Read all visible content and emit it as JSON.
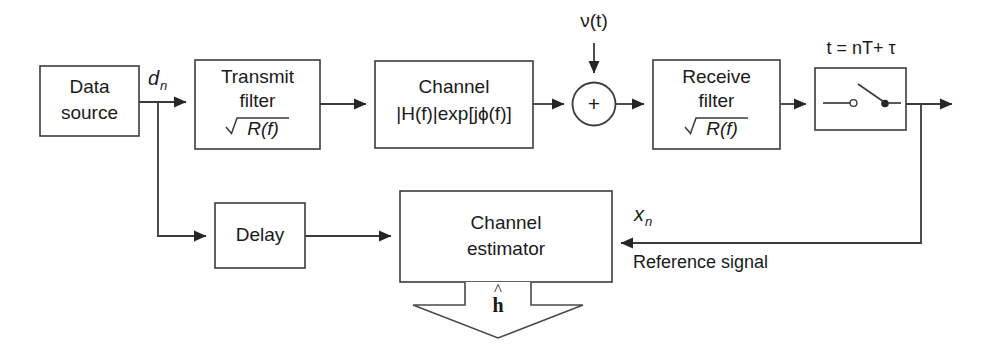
{
  "diagram": {
    "colors": {
      "background": "#ffffff",
      "stroke": "#3b3b3b",
      "text": "#1a1a1a",
      "arrow_fill": "#262626"
    },
    "blocks": {
      "data_source": {
        "line1": "Data",
        "line2": "source"
      },
      "transmit_filter": {
        "line1": "Transmit",
        "line2": "filter",
        "line3_radicand": "R(f)",
        "line3_full": "√R(f)"
      },
      "channel": {
        "line1": "Channel",
        "line2": "|H(f)|exp[jϕ(f)]"
      },
      "receive_filter": {
        "line1": "Receive",
        "line2": "filter",
        "line3_radicand": "R(f)",
        "line3_full": "√R(f)"
      },
      "sampler": {
        "label": "t = nT+ τ"
      },
      "delay": {
        "label": "Delay"
      },
      "channel_estimator": {
        "line1": "Channel",
        "line2": "estimator"
      },
      "summing_junction": {
        "symbol": "+"
      }
    },
    "signals": {
      "data_symbols": {
        "base": "d",
        "subscript": "n"
      },
      "noise": {
        "label": "ν(t)"
      },
      "sampled_output": {
        "base": "x",
        "subscript": "n"
      },
      "reference_signal": {
        "label": "Reference signal"
      },
      "estimate_output": {
        "base": "h",
        "accent": "^"
      }
    }
  }
}
